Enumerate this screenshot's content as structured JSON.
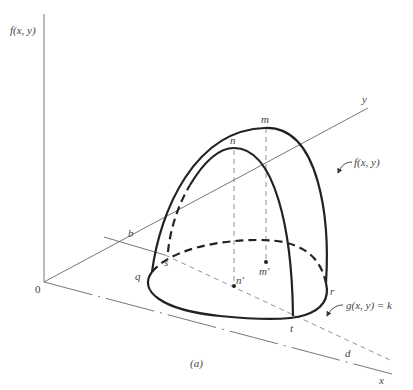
{
  "figure": {
    "caption": "(a)",
    "axes": {
      "vertical_label": "f(x, y)",
      "origin_label": "0",
      "y_label": "y",
      "x_label": "x"
    },
    "points": {
      "m": "m",
      "n": "n",
      "b": "b",
      "s": "s",
      "q": "q",
      "r": "r",
      "t": "t",
      "d": "d",
      "n_prime": "n′",
      "m_prime": "m′"
    },
    "annotations": {
      "surface": "f(x, y)",
      "constraint": "g(x, y) = k"
    },
    "colors": {
      "ink": "#222222",
      "thin_line": "#666666",
      "background": "#ffffff"
    }
  }
}
